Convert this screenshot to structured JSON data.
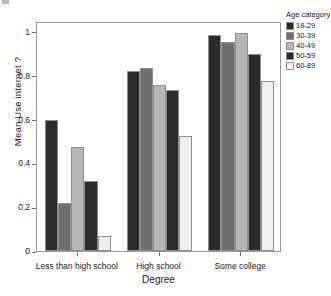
{
  "chart_data": {
    "type": "bar",
    "title": "",
    "xlabel": "Degree",
    "ylabel": "Mean Use internet ?",
    "categories": [
      "Less than high school",
      "High school",
      "Some college"
    ],
    "ylim": [
      0,
      1.05
    ],
    "yticks": [
      0,
      0.2,
      0.4,
      0.6,
      0.8,
      1
    ],
    "ytick_labels": [
      "0",
      "0.2",
      "0.4",
      "0.6",
      "0.8",
      "1"
    ],
    "grid": false,
    "legend_position": "right",
    "legend_title": "Age category",
    "series": [
      {
        "name": "18-29",
        "color": "#2b2b2b",
        "values": [
          0.6,
          0.82,
          0.985
        ]
      },
      {
        "name": "30-39",
        "color": "#6e6e6e",
        "values": [
          0.22,
          0.835,
          0.955
        ]
      },
      {
        "name": "40-49",
        "color": "#b6b6b6",
        "values": [
          0.475,
          0.76,
          0.995
        ]
      },
      {
        "name": "50-59",
        "color": "#2b2b2b",
        "values": [
          0.32,
          0.735,
          0.9
        ]
      },
      {
        "name": "60-89",
        "color": "#efefef",
        "values": [
          0.07,
          0.525,
          0.775
        ]
      }
    ]
  }
}
